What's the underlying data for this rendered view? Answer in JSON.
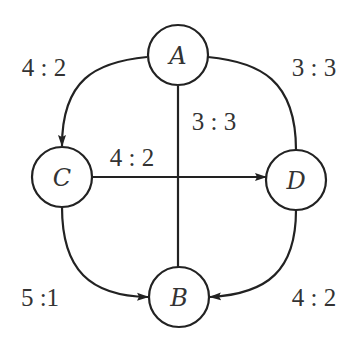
{
  "diagram": {
    "type": "directed-graph",
    "nodes": [
      {
        "id": "A",
        "label": "A"
      },
      {
        "id": "B",
        "label": "B"
      },
      {
        "id": "C",
        "label": "C"
      },
      {
        "id": "D",
        "label": "D"
      }
    ],
    "edges": [
      {
        "from": "A",
        "to": "C",
        "label": "4 : 2",
        "directed": true
      },
      {
        "from": "A",
        "to": "D",
        "label": "3 : 3",
        "directed": false
      },
      {
        "from": "A",
        "to": "B",
        "label": "3 : 3",
        "directed": false
      },
      {
        "from": "C",
        "to": "D",
        "label": "4 : 2",
        "directed": true
      },
      {
        "from": "C",
        "to": "B",
        "label": "5 :1",
        "directed": true
      },
      {
        "from": "D",
        "to": "B",
        "label": "4 : 2",
        "directed": true
      }
    ]
  },
  "colors": {
    "stroke": "#222222",
    "text": "#333333",
    "background": "#ffffff"
  }
}
